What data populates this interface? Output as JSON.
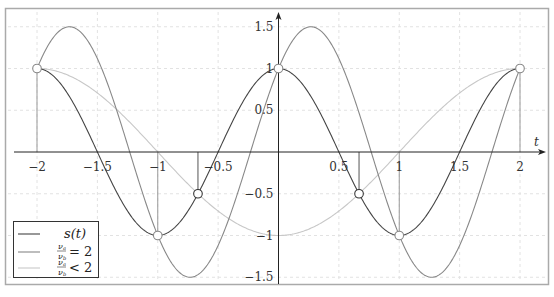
{
  "chart_data": {
    "type": "line",
    "title": "",
    "xlabel": "t",
    "ylabel": "",
    "xlim": [
      -2.2,
      2.2
    ],
    "ylim": [
      -1.65,
      1.65
    ],
    "grid": true,
    "legend_position": "lower left",
    "x_ticks": [
      "−2",
      "−1.5",
      "−1",
      "−0.5",
      "0.5",
      "1",
      "1.5",
      "2"
    ],
    "y_ticks": [
      "1.5",
      "1",
      "0.5",
      "−0.5",
      "−1",
      "−1.5"
    ],
    "series": [
      {
        "name": "s(t)",
        "color": "#444444",
        "formula": "cos(pi*t)",
        "points": [
          [
            -2,
            1
          ],
          [
            -1.5,
            0
          ],
          [
            -1,
            -1
          ],
          [
            -0.667,
            -0.5
          ],
          [
            -0.5,
            0
          ],
          [
            0,
            1
          ],
          [
            0.5,
            0
          ],
          [
            0.667,
            -0.5
          ],
          [
            1,
            -1
          ],
          [
            1.5,
            0
          ],
          [
            2,
            1
          ]
        ]
      },
      {
        "name": "ν_a/ν_b = 2",
        "color": "#888888",
        "formula": "1.5*cos(pi*(t-0.268))",
        "points": [
          [
            -2,
            1
          ],
          [
            -1.73,
            1.5
          ],
          [
            -1,
            -1
          ],
          [
            -0.73,
            -1.5
          ],
          [
            0,
            1
          ],
          [
            0.27,
            1.5
          ],
          [
            1,
            -1
          ],
          [
            1.27,
            -1.5
          ],
          [
            2,
            1
          ]
        ]
      },
      {
        "name": "ν_a/ν_b < 2",
        "color": "#c8c8c8",
        "formula": "-cos(pi*t/2)",
        "points": [
          [
            -2,
            1
          ],
          [
            -1,
            0
          ],
          [
            0,
            -1
          ],
          [
            1,
            0
          ],
          [
            2,
            1
          ]
        ]
      }
    ],
    "sample_points_light": [
      [
        -2,
        1
      ],
      [
        -1,
        -1
      ],
      [
        0,
        1
      ],
      [
        1,
        -1
      ],
      [
        2,
        1
      ]
    ],
    "sample_points_dark": [
      [
        -0.667,
        -0.5
      ],
      [
        0.667,
        -0.5
      ]
    ],
    "stems_at": [
      -2,
      -1,
      -0.667,
      0,
      0.667,
      1,
      2
    ]
  },
  "legend": {
    "items": [
      {
        "label": "s(t)",
        "color": "#444444"
      },
      {
        "num": "ν",
        "num_sub": "a",
        "den": "ν",
        "den_sub": "b",
        "rel": "= 2",
        "color": "#888888"
      },
      {
        "num": "ν",
        "num_sub": "a",
        "den": "ν",
        "den_sub": "b",
        "rel": "< 2",
        "color": "#c8c8c8"
      }
    ]
  },
  "axis": {
    "x_label": "t"
  }
}
